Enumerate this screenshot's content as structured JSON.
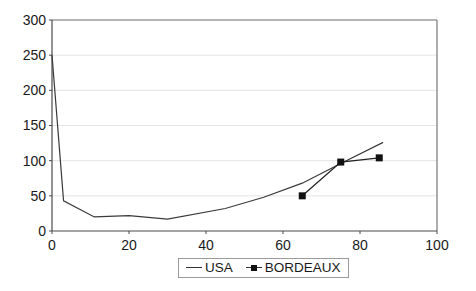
{
  "chart_data": {
    "type": "line",
    "title": "",
    "xlabel": "",
    "ylabel": "",
    "xlim": [
      0,
      100
    ],
    "ylim": [
      0,
      300
    ],
    "xticks": [
      0,
      20,
      40,
      60,
      80,
      100
    ],
    "yticks": [
      0,
      50,
      100,
      150,
      200,
      250,
      300
    ],
    "xtick_labels": [
      "0",
      "20",
      "40",
      "60",
      "80",
      "100"
    ],
    "ytick_labels": [
      "0",
      "50",
      "100",
      "150",
      "200",
      "250",
      "300"
    ],
    "grid": "horizontal",
    "legend_position": "bottom",
    "series": [
      {
        "name": "USA",
        "marker": "none",
        "color": "#3a3a3a",
        "points": [
          {
            "x": 0,
            "y": 250
          },
          {
            "x": 3,
            "y": 43
          },
          {
            "x": 11,
            "y": 20
          },
          {
            "x": 20,
            "y": 22
          },
          {
            "x": 30,
            "y": 17
          },
          {
            "x": 45,
            "y": 32
          },
          {
            "x": 55,
            "y": 48
          },
          {
            "x": 65,
            "y": 68
          },
          {
            "x": 75,
            "y": 96
          },
          {
            "x": 86,
            "y": 126
          }
        ]
      },
      {
        "name": "BORDEAUX",
        "marker": "square",
        "color": "#111111",
        "points": [
          {
            "x": 65,
            "y": 50
          },
          {
            "x": 75,
            "y": 98
          },
          {
            "x": 85,
            "y": 104
          }
        ]
      }
    ]
  },
  "legend": {
    "items": [
      {
        "label": "USA",
        "marker": "line"
      },
      {
        "label": "BORDEAUX",
        "marker": "line-square"
      }
    ]
  },
  "axes": {
    "y_labels": [
      "300",
      "250",
      "200",
      "150",
      "100",
      "50",
      "0"
    ],
    "x_labels": [
      "0",
      "20",
      "40",
      "60",
      "80",
      "100"
    ]
  },
  "colors": {
    "frame": "#5a5a5a",
    "grid": "#e2e2e2",
    "usa_line": "#3a3a3a",
    "bordeaux_line": "#111111",
    "text": "#1a1a1a"
  }
}
